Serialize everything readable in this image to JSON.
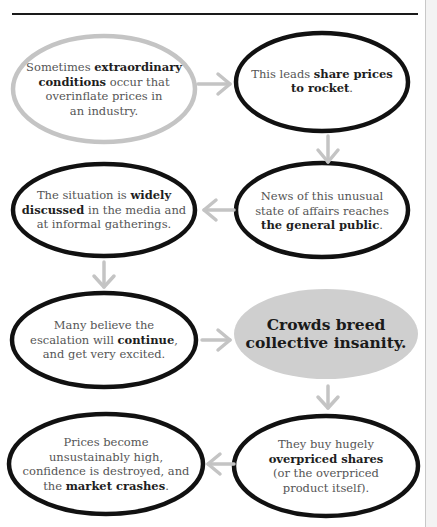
{
  "diagram": {
    "type": "flowchart",
    "colors": {
      "outline_dark": "#111111",
      "outline_light": "#c4c4c4",
      "arrow": "#c4c4c4",
      "key_fill": "#cfcfcf",
      "text": "#555555",
      "text_bold": "#1e1e1e"
    },
    "nodes": [
      {
        "id": "n1",
        "style": "light-outline",
        "parts": [
          {
            "t": "Sometimes ",
            "b": false
          },
          {
            "t": "extraordinary conditions",
            "b": true
          },
          {
            "t": " occur that overinflate prices in an industry.",
            "b": false
          }
        ]
      },
      {
        "id": "n2",
        "style": "dark-outline",
        "parts": [
          {
            "t": "This leads ",
            "b": false
          },
          {
            "t": "share prices to rocket",
            "b": true
          },
          {
            "t": ".",
            "b": false
          }
        ]
      },
      {
        "id": "n3",
        "style": "dark-outline",
        "parts": [
          {
            "t": "News of this unusual state of affairs reaches ",
            "b": false
          },
          {
            "t": "the general public",
            "b": true
          },
          {
            "t": ".",
            "b": false
          }
        ]
      },
      {
        "id": "n4",
        "style": "dark-outline",
        "parts": [
          {
            "t": "The situation is ",
            "b": false
          },
          {
            "t": "widely discussed",
            "b": true
          },
          {
            "t": " in the media and at informal gatherings.",
            "b": false
          }
        ]
      },
      {
        "id": "n5",
        "style": "dark-outline",
        "parts": [
          {
            "t": "Many believe the escalation will ",
            "b": false
          },
          {
            "t": "continue",
            "b": true
          },
          {
            "t": ", and get very excited.",
            "b": false
          }
        ]
      },
      {
        "id": "n6",
        "style": "filled-key",
        "parts": [
          {
            "t": "Crowds breed collective insanity.",
            "b": true
          }
        ]
      },
      {
        "id": "n7",
        "style": "dark-outline",
        "parts": [
          {
            "t": "They buy hugely ",
            "b": false
          },
          {
            "t": "overpriced shares",
            "b": true
          },
          {
            "t": " (or the overpriced product itself).",
            "b": false
          }
        ]
      },
      {
        "id": "n8",
        "style": "dark-outline",
        "parts": [
          {
            "t": "Prices become unsustainably high, confidence is destroyed, and the ",
            "b": false
          },
          {
            "t": "market crashes",
            "b": true
          },
          {
            "t": ".",
            "b": false
          }
        ]
      }
    ],
    "edges": [
      {
        "from": "n1",
        "to": "n2",
        "direction": "right"
      },
      {
        "from": "n2",
        "to": "n3",
        "direction": "down"
      },
      {
        "from": "n3",
        "to": "n4",
        "direction": "left"
      },
      {
        "from": "n4",
        "to": "n5",
        "direction": "down"
      },
      {
        "from": "n5",
        "to": "n6",
        "direction": "right"
      },
      {
        "from": "n6",
        "to": "n7",
        "direction": "down"
      },
      {
        "from": "n7",
        "to": "n8",
        "direction": "left"
      }
    ]
  },
  "text": {
    "n1": {
      "a": "Sometimes ",
      "b": "extraordinary",
      "c": "conditions",
      "d": " occur that",
      "e": "overinflate prices in",
      "f": "an industry."
    },
    "n2": {
      "a": "This leads ",
      "b": "share prices",
      "c": "to rocket",
      "d": "."
    },
    "n3": {
      "a": "News of this unusual",
      "b": "state of affairs reaches",
      "c": "the general public",
      "d": "."
    },
    "n4": {
      "a": "The situation is ",
      "b": "widely",
      "c": "discussed",
      "d": " in the media and",
      "e": "at informal gatherings."
    },
    "n5": {
      "a": "Many believe the",
      "b": "escalation will ",
      "c": "continue",
      "d": ",",
      "e": "and get very excited."
    },
    "n6": {
      "a": "Crowds breed",
      "b": "collective insanity."
    },
    "n7": {
      "a": "They buy hugely",
      "b": "overpriced shares",
      "c": "(or the overpriced",
      "d": "product itself)."
    },
    "n8": {
      "a": "Prices become",
      "b": "unsustainably high,",
      "c": "confidence is destroyed, and",
      "d": "the ",
      "e": "market crashes",
      "f": "."
    }
  }
}
